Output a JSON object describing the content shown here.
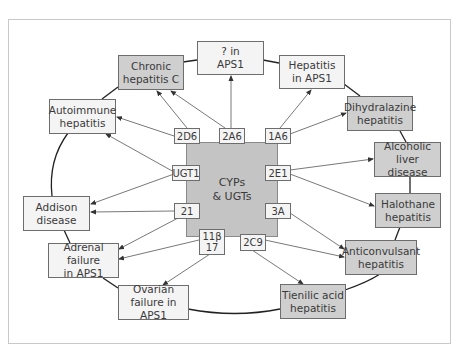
{
  "diagram": {
    "center": {
      "label": "CYPs\n& UGTs"
    },
    "enzymes": [
      {
        "id": "2D6",
        "label": "2D6"
      },
      {
        "id": "2A6",
        "label": "2A6"
      },
      {
        "id": "1A6",
        "label": "1A6"
      },
      {
        "id": "UGT1",
        "label": "UGT1"
      },
      {
        "id": "2E1",
        "label": "2E1"
      },
      {
        "id": "21",
        "label": "21"
      },
      {
        "id": "3A",
        "label": "3A"
      },
      {
        "id": "11b17",
        "label": "11β\n17"
      },
      {
        "id": "2C9",
        "label": "2C9"
      }
    ],
    "diseases": [
      {
        "id": "chronic-hep-c",
        "label": "Chronic\nhepatitis C",
        "shade": "dark"
      },
      {
        "id": "q-aps1",
        "label": "? in\nAPS1",
        "shade": "light"
      },
      {
        "id": "hep-aps1",
        "label": "Hepatitis\nin APS1",
        "shade": "light"
      },
      {
        "id": "autoimmune-hep",
        "label": "Autoimmune\nhepatitis",
        "shade": "light"
      },
      {
        "id": "dihydralazine-hep",
        "label": "Dihydralazine\nhepatitis",
        "shade": "dark"
      },
      {
        "id": "alcoholic-liver",
        "label": "Alcoholic\nliver disease",
        "shade": "dark"
      },
      {
        "id": "addison",
        "label": "Addison\ndisease",
        "shade": "light"
      },
      {
        "id": "halothane-hep",
        "label": "Halothane\nhepatitis",
        "shade": "dark"
      },
      {
        "id": "adrenal-aps1",
        "label": "Adrenal failure\nin APS1",
        "shade": "light"
      },
      {
        "id": "anticonvulsant-hep",
        "label": "Anticonvulsant\nhepatitis",
        "shade": "dark"
      },
      {
        "id": "ovarian-aps1",
        "label": "Ovarian\nfailure in APS1",
        "shade": "light"
      },
      {
        "id": "tienilic-hep",
        "label": "Tienilic acid\nhepatitis",
        "shade": "dark"
      }
    ],
    "edges": [
      {
        "from": "2D6",
        "to": "Chronic hepatitis C"
      },
      {
        "from": "2A6",
        "to": "Chronic hepatitis C"
      },
      {
        "from": "2D6",
        "to": "Autoimmune hepatitis"
      },
      {
        "from": "UGT1",
        "to": "Autoimmune hepatitis"
      },
      {
        "from": "2A6",
        "to": "? in APS1"
      },
      {
        "from": "1A6",
        "to": "Hepatitis in APS1"
      },
      {
        "from": "1A6",
        "to": "Dihydralazine hepatitis"
      },
      {
        "from": "2E1",
        "to": "Alcoholic liver disease"
      },
      {
        "from": "2E1",
        "to": "Halothane hepatitis"
      },
      {
        "from": "UGT1",
        "to": "Addison disease"
      },
      {
        "from": "21",
        "to": "Addison disease"
      },
      {
        "from": "21",
        "to": "Adrenal failure in APS1"
      },
      {
        "from": "11β17",
        "to": "Adrenal failure in APS1"
      },
      {
        "from": "11β17",
        "to": "Ovarian failure in APS1"
      },
      {
        "from": "3A",
        "to": "Anticonvulsant hepatitis"
      },
      {
        "from": "2C9",
        "to": "Anticonvulsant hepatitis"
      },
      {
        "from": "2C9",
        "to": "Tienilic acid hepatitis"
      }
    ],
    "colors": {
      "dark_fill": "#cfcfcf",
      "light_fill": "#f4f4f4",
      "core_fill": "#c4c4c4",
      "stroke": "#6d6d6d"
    }
  }
}
